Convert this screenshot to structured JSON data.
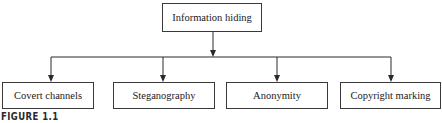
{
  "diagram": {
    "root": {
      "label": "Information hiding"
    },
    "children": [
      {
        "label": "Covert channels"
      },
      {
        "label": "Steganography"
      },
      {
        "label": "Anonymity"
      },
      {
        "label": "Copyright marking"
      }
    ],
    "edge_color": "#2a2a2a",
    "box_border_color": "#3a3a3a"
  },
  "caption": {
    "text": "FIGURE 1.1"
  }
}
